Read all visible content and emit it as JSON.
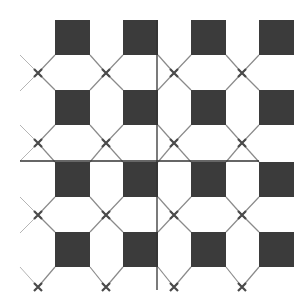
{
  "diagram": {
    "type": "tile-pattern",
    "width": 308,
    "height": 304,
    "background": "#ffffff",
    "square_color": "#3b3b3b",
    "line_color": "#8a8a8a",
    "cross_color": "#4a4a4a",
    "axis_color": "#333333",
    "columns_x": [
      55,
      123,
      191,
      259
    ],
    "rows_y": [
      20,
      90,
      162,
      232
    ],
    "square_size": 35,
    "cross_x": [
      38,
      106,
      174,
      242
    ],
    "cross_y": [
      73,
      143,
      215,
      287
    ],
    "left_line_extent_x": 20,
    "horizontal_axis": {
      "x1": 20,
      "x2": 259,
      "y": 161
    },
    "vertical_axis": {
      "x": 157,
      "y1": 20,
      "y2": 290
    }
  }
}
